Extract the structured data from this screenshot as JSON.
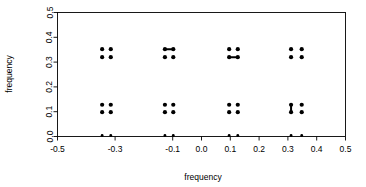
{
  "chart_data": {
    "type": "scatter",
    "title": "",
    "subtitle": "",
    "xlabel": "frequency",
    "ylabel": "frequency",
    "xlim": [
      -0.5,
      0.5
    ],
    "ylim": [
      0.0,
      0.5
    ],
    "xticks": [
      -0.5,
      -0.3,
      -0.1,
      0.0,
      0.1,
      0.2,
      0.3,
      0.4,
      0.5
    ],
    "xticklabels": [
      "-0.5",
      "-0.3",
      "-0.1",
      "0.0",
      "0.1",
      "0.2",
      "0.3",
      "0.4",
      "0.5"
    ],
    "yticks": [
      0.0,
      0.1,
      0.2,
      0.3,
      0.4,
      0.5
    ],
    "yticklabels": [
      "0.0",
      "0.1",
      "0.2",
      "0.3",
      "0.4",
      "0.5"
    ],
    "grid": false,
    "legend": null,
    "legend_position": "none",
    "marker": "filled-circle",
    "marker_color": "#000000",
    "series": [
      {
        "name": "frequency pairs",
        "points": [
          {
            "x": -0.345,
            "y": 0.352
          },
          {
            "x": -0.315,
            "y": 0.352
          },
          {
            "x": -0.345,
            "y": 0.32
          },
          {
            "x": -0.315,
            "y": 0.32
          },
          {
            "x": -0.345,
            "y": 0.128
          },
          {
            "x": -0.315,
            "y": 0.128
          },
          {
            "x": -0.345,
            "y": 0.098
          },
          {
            "x": -0.315,
            "y": 0.098
          },
          {
            "x": -0.345,
            "y": 0.004
          },
          {
            "x": -0.315,
            "y": 0.004
          },
          {
            "x": -0.127,
            "y": 0.352
          },
          {
            "x": -0.098,
            "y": 0.352
          },
          {
            "x": -0.127,
            "y": 0.32
          },
          {
            "x": -0.098,
            "y": 0.32
          },
          {
            "x": -0.127,
            "y": 0.128
          },
          {
            "x": -0.098,
            "y": 0.128
          },
          {
            "x": -0.127,
            "y": 0.098
          },
          {
            "x": -0.098,
            "y": 0.098
          },
          {
            "x": -0.127,
            "y": 0.004
          },
          {
            "x": -0.098,
            "y": 0.004
          },
          {
            "x": 0.096,
            "y": 0.352
          },
          {
            "x": 0.126,
            "y": 0.352
          },
          {
            "x": 0.096,
            "y": 0.32
          },
          {
            "x": 0.126,
            "y": 0.32
          },
          {
            "x": 0.096,
            "y": 0.128
          },
          {
            "x": 0.126,
            "y": 0.128
          },
          {
            "x": 0.096,
            "y": 0.098
          },
          {
            "x": 0.126,
            "y": 0.098
          },
          {
            "x": 0.096,
            "y": 0.004
          },
          {
            "x": 0.126,
            "y": 0.004
          },
          {
            "x": 0.311,
            "y": 0.352
          },
          {
            "x": 0.348,
            "y": 0.352
          },
          {
            "x": 0.311,
            "y": 0.32
          },
          {
            "x": 0.348,
            "y": 0.32
          },
          {
            "x": 0.311,
            "y": 0.128
          },
          {
            "x": 0.348,
            "y": 0.128
          },
          {
            "x": 0.311,
            "y": 0.098
          },
          {
            "x": 0.348,
            "y": 0.098
          },
          {
            "x": 0.311,
            "y": 0.004
          },
          {
            "x": 0.348,
            "y": 0.004
          }
        ],
        "connectors": [
          {
            "x1": -0.127,
            "y1": 0.352,
            "x2": -0.098,
            "y2": 0.352
          },
          {
            "x1": 0.096,
            "y1": 0.32,
            "x2": 0.126,
            "y2": 0.32
          },
          {
            "x1": 0.311,
            "y1": 0.128,
            "x2": 0.311,
            "y2": 0.098
          }
        ]
      }
    ]
  }
}
